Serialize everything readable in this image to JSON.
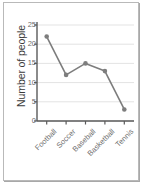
{
  "chart_data": {
    "type": "line",
    "title": "",
    "xlabel": "",
    "ylabel": "Number of people",
    "categories": [
      "Football",
      "Soccer",
      "Baseball",
      "Basketball",
      "Tennis"
    ],
    "values": [
      22,
      12,
      15,
      13,
      3
    ],
    "ylim": [
      0,
      25
    ],
    "yticks": [
      0,
      5,
      10,
      15,
      20,
      25
    ],
    "ytick_labels": [
      "0",
      "5",
      "10",
      "15",
      "20",
      "25"
    ],
    "grid": "horizontal",
    "legend": "none",
    "marker": "circle",
    "series_color": "#7d7d7d",
    "axis_color": "#5a5a5a",
    "grid_color": "#e3e3e3",
    "label_color": "#6d6d6d",
    "title_color": "#3b3b3b",
    "background": "#ffffff",
    "border_color": "#b9b9b9"
  }
}
